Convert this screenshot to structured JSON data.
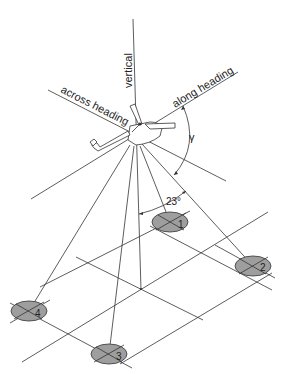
{
  "diagram": {
    "labels": {
      "vertical": "vertical",
      "across_heading": "across heading",
      "along_heading": "along heading",
      "gamma": "γ",
      "angle": "23°"
    },
    "footprints": [
      {
        "id": "1",
        "label": "1"
      },
      {
        "id": "2",
        "label": "2"
      },
      {
        "id": "3",
        "label": "3"
      },
      {
        "id": "4",
        "label": "4"
      }
    ],
    "colors": {
      "footprint_fill": "#9e9e9e",
      "line": "#333333"
    }
  }
}
